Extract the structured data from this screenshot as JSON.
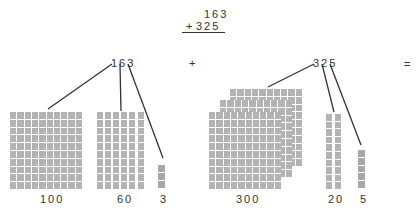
{
  "problem": {
    "addend1": "163",
    "operator": "+",
    "addend2": "325"
  },
  "left_group": {
    "number": "163",
    "blocks": {
      "hundreds": {
        "count": 1,
        "label": "100"
      },
      "tens": {
        "count": 6,
        "label": "60"
      },
      "ones": {
        "count": 3,
        "label": "3"
      }
    }
  },
  "plus_sign": "+",
  "right_group": {
    "number": "325",
    "blocks": {
      "hundreds": {
        "count": 3,
        "label": "300"
      },
      "tens": {
        "count": 2,
        "label": "20"
      },
      "ones": {
        "count": 5,
        "label": "5"
      }
    }
  },
  "equals_sign": "=",
  "colors": {
    "block_fill": "#b3b3b3",
    "unit_fill": "#a8a8a8",
    "line": "#333333",
    "text": "#333333"
  }
}
